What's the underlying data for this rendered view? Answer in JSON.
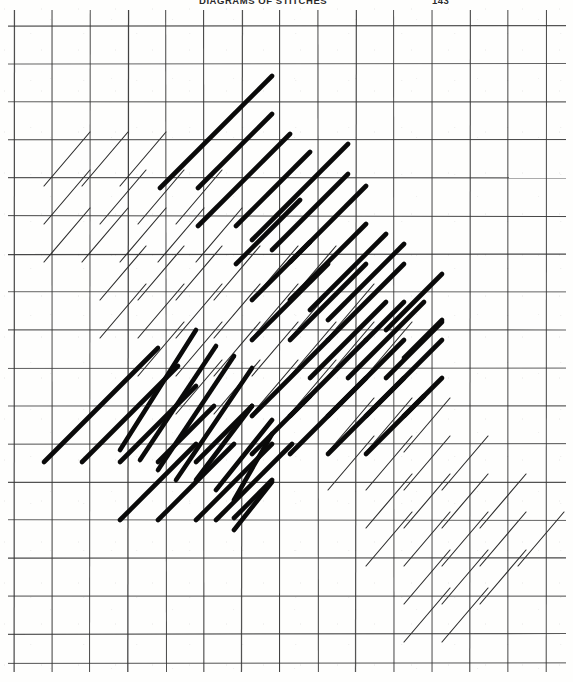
{
  "page": {
    "width": 573,
    "height": 682,
    "background_color": "#fefefd",
    "media": "scanned-book-page"
  },
  "header": {
    "running_title": "DIAGRAMS OF STITCHES",
    "page_number": "143"
  },
  "figure": {
    "name": "stitch-diagram",
    "ink_color": "#0a0a0a",
    "grid_color": "#3a3a3a"
  },
  "chart_data": {
    "type": "scatter",
    "title": "DIAGRAMS OF STITCHES",
    "xlabel": "",
    "ylabel": "",
    "grid": true,
    "legend_position": "none",
    "xlim": [
      0,
      573
    ],
    "ylim": [
      0,
      682
    ],
    "grid_spec": {
      "vertical_x": [
        14,
        52,
        90,
        128,
        166,
        204,
        242,
        280,
        318,
        356,
        394,
        432,
        470,
        508,
        546
      ],
      "horizontal_y": [
        26,
        64,
        102,
        140,
        178,
        216,
        254,
        292,
        330,
        368,
        406,
        444,
        482,
        520,
        558,
        596,
        634,
        663
      ],
      "cell_width": 38,
      "cell_height": 38,
      "vertical_top": 10,
      "vertical_bottom": 672,
      "horizontal_left": 8,
      "horizontal_right": 566
    },
    "series": [
      {
        "name": "thin-strokes",
        "weight": "thin",
        "stroke_width": 1.15,
        "color": "#2e2e2e",
        "values": [
          [
            44,
            186,
            90,
            132
          ],
          [
            82,
            186,
            128,
            132
          ],
          [
            120,
            186,
            166,
            132
          ],
          [
            44,
            224,
            90,
            170
          ],
          [
            100,
            224,
            146,
            170
          ],
          [
            138,
            224,
            184,
            170
          ],
          [
            176,
            224,
            222,
            170
          ],
          [
            44,
            262,
            90,
            208
          ],
          [
            82,
            262,
            128,
            208
          ],
          [
            120,
            262,
            166,
            208
          ],
          [
            158,
            262,
            204,
            208
          ],
          [
            196,
            262,
            242,
            208
          ],
          [
            100,
            300,
            146,
            246
          ],
          [
            138,
            300,
            184,
            246
          ],
          [
            176,
            300,
            222,
            246
          ],
          [
            214,
            300,
            260,
            246
          ],
          [
            252,
            300,
            298,
            246
          ],
          [
            290,
            300,
            336,
            246
          ],
          [
            100,
            338,
            146,
            284
          ],
          [
            138,
            338,
            184,
            284
          ],
          [
            176,
            338,
            222,
            284
          ],
          [
            214,
            338,
            260,
            284
          ],
          [
            252,
            338,
            298,
            284
          ],
          [
            290,
            338,
            336,
            284
          ],
          [
            328,
            338,
            374,
            284
          ],
          [
            138,
            376,
            184,
            322
          ],
          [
            176,
            376,
            222,
            322
          ],
          [
            214,
            376,
            260,
            322
          ],
          [
            252,
            376,
            298,
            322
          ],
          [
            290,
            376,
            336,
            322
          ],
          [
            328,
            376,
            374,
            322
          ],
          [
            366,
            376,
            412,
            322
          ],
          [
            176,
            414,
            222,
            360
          ],
          [
            214,
            414,
            260,
            360
          ],
          [
            252,
            414,
            298,
            360
          ],
          [
            290,
            414,
            336,
            360
          ],
          [
            328,
            452,
            374,
            398
          ],
          [
            366,
            452,
            412,
            398
          ],
          [
            404,
            452,
            450,
            398
          ],
          [
            328,
            490,
            374,
            436
          ],
          [
            366,
            490,
            412,
            436
          ],
          [
            404,
            490,
            450,
            436
          ],
          [
            442,
            490,
            488,
            436
          ],
          [
            366,
            528,
            412,
            474
          ],
          [
            404,
            528,
            450,
            474
          ],
          [
            442,
            528,
            488,
            474
          ],
          [
            480,
            528,
            526,
            474
          ],
          [
            366,
            566,
            412,
            512
          ],
          [
            404,
            566,
            450,
            512
          ],
          [
            442,
            566,
            488,
            512
          ],
          [
            480,
            566,
            526,
            512
          ],
          [
            518,
            566,
            564,
            512
          ],
          [
            404,
            604,
            450,
            550
          ],
          [
            442,
            604,
            488,
            550
          ],
          [
            480,
            604,
            526,
            550
          ],
          [
            404,
            642,
            450,
            588
          ],
          [
            442,
            642,
            488,
            588
          ]
        ]
      },
      {
        "name": "bold-strokes",
        "weight": "bold",
        "stroke_width": 4.6,
        "color": "#0a0a0a",
        "values": [
          [
            160,
            188,
            272,
            76
          ],
          [
            198,
            188,
            272,
            114
          ],
          [
            198,
            226,
            290,
            134
          ],
          [
            236,
            226,
            310,
            152
          ],
          [
            252,
            240,
            348,
            144
          ],
          [
            272,
            250,
            348,
            174
          ],
          [
            290,
            262,
            366,
            186
          ],
          [
            236,
            264,
            300,
            200
          ],
          [
            290,
            300,
            366,
            224
          ],
          [
            310,
            310,
            386,
            234
          ],
          [
            328,
            320,
            404,
            244
          ],
          [
            252,
            300,
            310,
            242
          ],
          [
            252,
            340,
            328,
            264
          ],
          [
            290,
            340,
            366,
            264
          ],
          [
            328,
            340,
            404,
            264
          ],
          [
            366,
            340,
            404,
            302
          ],
          [
            386,
            330,
            442,
            274
          ],
          [
            310,
            378,
            386,
            302
          ],
          [
            348,
            378,
            424,
            302
          ],
          [
            386,
            378,
            442,
            322
          ],
          [
            404,
            358,
            442,
            320
          ],
          [
            120,
            450,
            196,
            330
          ],
          [
            140,
            460,
            216,
            346
          ],
          [
            158,
            470,
            234,
            356
          ],
          [
            176,
            480,
            252,
            368
          ],
          [
            196,
            480,
            252,
            406
          ],
          [
            216,
            490,
            272,
            420
          ],
          [
            234,
            500,
            272,
            434
          ],
          [
            44,
            462,
            158,
            348
          ],
          [
            82,
            462,
            178,
            366
          ],
          [
            120,
            462,
            196,
            386
          ],
          [
            158,
            462,
            214,
            406
          ],
          [
            196,
            462,
            252,
            406
          ],
          [
            216,
            520,
            292,
            444
          ],
          [
            234,
            530,
            272,
            482
          ],
          [
            120,
            520,
            196,
            444
          ],
          [
            158,
            520,
            234,
            444
          ],
          [
            196,
            520,
            272,
            444
          ],
          [
            234,
            518,
            272,
            480
          ],
          [
            366,
            416,
            442,
            340
          ],
          [
            404,
            416,
            442,
            378
          ],
          [
            328,
            416,
            404,
            340
          ],
          [
            290,
            416,
            366,
            340
          ],
          [
            252,
            416,
            328,
            340
          ],
          [
            290,
            454,
            366,
            378
          ],
          [
            328,
            454,
            404,
            378
          ],
          [
            366,
            454,
            424,
            396
          ],
          [
            252,
            454,
            310,
            396
          ]
        ]
      }
    ]
  }
}
